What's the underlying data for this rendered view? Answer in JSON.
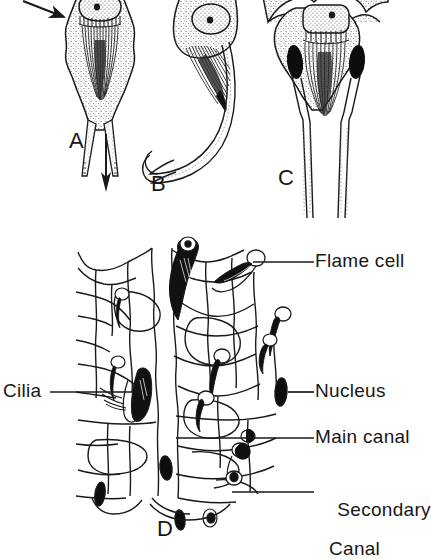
{
  "figure": {
    "ink_color": "#1a1a1a",
    "background_color": "#ffffff",
    "stipple_color": "#555555"
  },
  "panels": [
    {
      "id": "A",
      "letter": "A",
      "caption": "Flame cell with cilia tuft and straight terminal canal"
    },
    {
      "id": "B",
      "letter": "B",
      "caption": "Flame cell with long curved terminal canal"
    },
    {
      "id": "C",
      "letter": "C",
      "caption": "Flame cell with two dark nuclei flanking the cilia tuft"
    },
    {
      "id": "D",
      "letter": "D",
      "caption": "Network of flame cells joined to main and secondary canals"
    }
  ],
  "labels": [
    {
      "key": "flame_cell",
      "text": "Flame cell",
      "line": 1
    },
    {
      "key": "nucleus",
      "text": "Nucleus",
      "line": 1
    },
    {
      "key": "main_canal",
      "text": "Main canal",
      "line": 1
    },
    {
      "key": "secondary_canal_1",
      "text": "Secondary",
      "line": 1
    },
    {
      "key": "secondary_canal_2",
      "text": "Canal",
      "line": 2
    },
    {
      "key": "cilia",
      "text": "Cilia",
      "line": 1
    }
  ],
  "arrows": [
    {
      "key": "inflow_arrow",
      "direction": "down-right",
      "meaning": "fluid entering the flame cell"
    },
    {
      "key": "outflow_arrow",
      "direction": "down",
      "meaning": "fluid flowing out through the canal"
    }
  ]
}
